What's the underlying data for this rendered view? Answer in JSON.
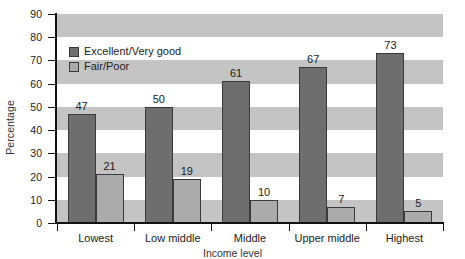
{
  "chart_data": {
    "type": "bar",
    "title": "",
    "xlabel": "Income level",
    "ylabel": "Percentage",
    "categories": [
      "Lowest",
      "Low middle",
      "Middle",
      "Upper middle",
      "Highest"
    ],
    "series": [
      {
        "name": "Excellent/Very good",
        "color": "#6e6e6e",
        "values": [
          47,
          50,
          61,
          67,
          73
        ]
      },
      {
        "name": "Fair/Poor",
        "color": "#ababab",
        "values": [
          21,
          19,
          10,
          7,
          5
        ]
      }
    ],
    "ylim": [
      0,
      90
    ],
    "ytick_step": 10,
    "yticks": [
      0,
      10,
      20,
      30,
      40,
      50,
      60,
      70,
      80,
      90
    ],
    "ytick_labels": [
      "0",
      "10",
      "20",
      "30",
      "40",
      "50",
      "60",
      "70",
      "80",
      "90"
    ],
    "grid": "horizontal-alternating-bands",
    "legend_position": "upper-left-inside",
    "data_labels": true
  }
}
